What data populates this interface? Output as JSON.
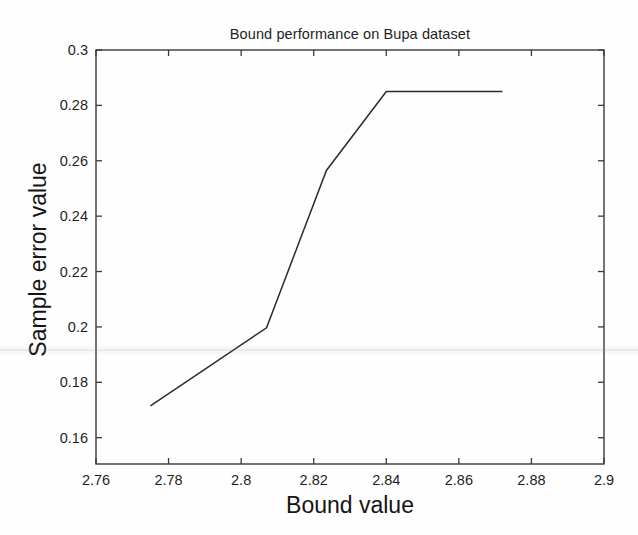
{
  "figure": {
    "background_color": "#fefefe",
    "line_color": "#2b2b2b",
    "axis_color": "#3a3a3a"
  },
  "chart_data": {
    "type": "line",
    "title": "Bound performance on Bupa dataset",
    "xlabel": "Bound value",
    "ylabel": "Sample error value",
    "xlim": [
      2.76,
      2.9
    ],
    "ylim": [
      0.1505,
      0.3
    ],
    "grid": false,
    "legend": null,
    "xticks": [
      2.76,
      2.78,
      2.8,
      2.82,
      2.84,
      2.86,
      2.88,
      2.9
    ],
    "xticklabels": [
      "2.76",
      "2.78",
      "2.8",
      "2.82",
      "2.84",
      "2.86",
      "2.88",
      "2.9"
    ],
    "yticks": [
      0.16,
      0.18,
      0.2,
      0.22,
      0.24,
      0.26,
      0.28,
      0.3
    ],
    "yticklabels": [
      "0.16",
      "0.18",
      "0.2",
      "0.22",
      "0.24",
      "0.26",
      "0.28",
      "0.3"
    ],
    "series": [
      {
        "name": "Sample error",
        "color": "#2b2b2b",
        "marker": "none",
        "x": [
          2.775,
          2.807,
          2.8235,
          2.84,
          2.872
        ],
        "y": [
          0.1715,
          0.1997,
          0.2565,
          0.285,
          0.285
        ]
      }
    ]
  }
}
